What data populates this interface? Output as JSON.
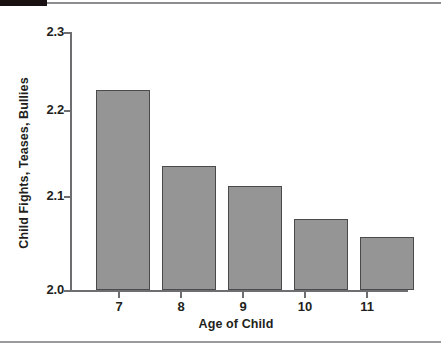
{
  "chart_data": {
    "type": "bar",
    "title": "",
    "xlabel": "Age of Child",
    "ylabel": "Child Fights, Teases, Bullies",
    "categories": [
      "7",
      "8",
      "9",
      "10",
      "11"
    ],
    "values": [
      2.232,
      2.144,
      2.121,
      2.082,
      2.062
    ],
    "ylim": [
      2.0,
      2.3
    ],
    "yticks": [
      "2.0",
      "2.1",
      "2.2",
      "2.3"
    ],
    "ytick_values": [
      2.0,
      2.1,
      2.2,
      2.3
    ],
    "grid": false,
    "legend": null,
    "bar_color": "#959595",
    "bar_edge_color": "#4a4a4a",
    "axis_color": "#6e6e70",
    "text_color": "#231f20",
    "background": "#ffffff"
  },
  "decorations": {
    "top_rule_color": "#8d8d8f",
    "top_tab_color": "#1a1113",
    "bottom_rule_color": "#9a9a9c"
  }
}
